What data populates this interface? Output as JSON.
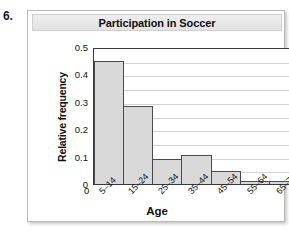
{
  "exercise": {
    "number": "6."
  },
  "chart_data": {
    "type": "bar",
    "title": "Participation in Soccer",
    "xlabel": "Age",
    "ylabel": "Relative frequency",
    "categories": [
      "5–14",
      "15–24",
      "25–34",
      "35–44",
      "45–54",
      "55–64",
      "65–74"
    ],
    "values": [
      0.45,
      0.285,
      0.09,
      0.105,
      0.048,
      0.012,
      0.01
    ],
    "ylim": [
      0,
      0.5
    ],
    "ytick_labels": [
      "0",
      "0.1",
      "0.2",
      "0.3",
      "0.4",
      "0.5"
    ],
    "ytick_values": [
      0,
      0.1,
      0.2,
      0.3,
      0.4,
      0.5
    ],
    "gridlines": [
      0.05,
      0.1,
      0.15,
      0.2,
      0.25,
      0.3,
      0.35,
      0.4,
      0.45
    ],
    "grid": true,
    "legend": null,
    "bar_fill_color": "#d9d9d9",
    "bar_edge_color": "#4a4a4a",
    "gridline_color": "#d2d2d9",
    "frame_color": "#3a3a3a",
    "title_banner_color": "#e8e8e8"
  }
}
